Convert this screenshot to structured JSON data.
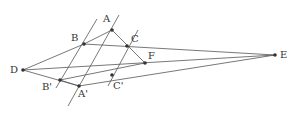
{
  "diagram": {
    "type": "geometry-projective",
    "points": {
      "A": {
        "label": "A",
        "x": 112,
        "y": 30
      },
      "B": {
        "label": "B",
        "x": 84,
        "y": 44
      },
      "C": {
        "label": "C",
        "x": 127,
        "y": 46
      },
      "D": {
        "label": "D",
        "x": 23,
        "y": 70
      },
      "E": {
        "label": "E",
        "x": 275,
        "y": 55
      },
      "F": {
        "label": "F",
        "x": 145,
        "y": 63
      },
      "A_prime": {
        "label": "A'",
        "x": 79,
        "y": 86
      },
      "B_prime": {
        "label": "B'",
        "x": 60,
        "y": 80
      },
      "C_prime": {
        "label": "C'",
        "x": 112,
        "y": 75
      }
    }
  }
}
